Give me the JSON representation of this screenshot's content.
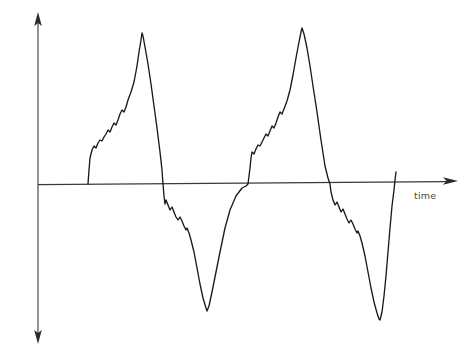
{
  "figure": {
    "title": "",
    "background_color": "#ffffff",
    "width": 470,
    "height": 355
  },
  "axes": {
    "y_label": "amplitude",
    "x_label": "time",
    "axis_color": "#3a3a3a",
    "origin_px": {
      "x": 38,
      "y": 184
    },
    "y_axis_top_px": 16,
    "y_axis_bottom_px": 340,
    "x_axis_right_px": 460,
    "has_y_arrow_up": true,
    "has_y_arrow_down": true,
    "has_x_arrow_right": true,
    "tick_labels_x": [],
    "tick_labels_y": [],
    "grid": false
  },
  "chart_data": {
    "type": "line",
    "title": "",
    "xlabel": "time",
    "ylabel": "amplitude",
    "legend": [],
    "legend_position": "none",
    "grid": false,
    "xlim": [
      0,
      470
    ],
    "ylim": [
      -1.15,
      1.1
    ],
    "line_color": "#1a1a1a",
    "cycles": 2,
    "zero_level_px": 184,
    "peaks": [
      {
        "x_px": 142,
        "y_px": 33,
        "amplitude": 1.0
      },
      {
        "x_px": 268,
        "y_px": 28,
        "amplitude": 1.04
      }
    ],
    "troughs": [
      {
        "x_px": 207,
        "y_px": 311,
        "amplitude": -0.93
      },
      {
        "x_px": 364,
        "y_px": 320,
        "amplitude": -0.99
      }
    ],
    "zero_crossings_px": [
      88,
      163,
      248,
      330,
      388
    ],
    "series": [
      {
        "name": "waveform",
        "points_px": [
          [
            88,
            184
          ],
          [
            89,
            170
          ],
          [
            90,
            158
          ],
          [
            92,
            150
          ],
          [
            94,
            146
          ],
          [
            96,
            148
          ],
          [
            98,
            143
          ],
          [
            100,
            140
          ],
          [
            102,
            141
          ],
          [
            104,
            137
          ],
          [
            106,
            134
          ],
          [
            108,
            130
          ],
          [
            110,
            132
          ],
          [
            112,
            127
          ],
          [
            114,
            123
          ],
          [
            116,
            125
          ],
          [
            118,
            120
          ],
          [
            120,
            114
          ],
          [
            122,
            110
          ],
          [
            124,
            112
          ],
          [
            126,
            107
          ],
          [
            128,
            100
          ],
          [
            131,
            92
          ],
          [
            134,
            82
          ],
          [
            137,
            66
          ],
          [
            139,
            52
          ],
          [
            141,
            40
          ],
          [
            142,
            33
          ],
          [
            143,
            36
          ],
          [
            145,
            47
          ],
          [
            148,
            64
          ],
          [
            151,
            84
          ],
          [
            154,
            106
          ],
          [
            157,
            128
          ],
          [
            160,
            152
          ],
          [
            162,
            170
          ],
          [
            163,
            184
          ],
          [
            164,
            196
          ],
          [
            165,
            204
          ],
          [
            166,
            200
          ],
          [
            168,
            205
          ],
          [
            170,
            210
          ],
          [
            172,
            207
          ],
          [
            174,
            212
          ],
          [
            176,
            217
          ],
          [
            178,
            220
          ],
          [
            180,
            217
          ],
          [
            182,
            221
          ],
          [
            184,
            226
          ],
          [
            186,
            230
          ],
          [
            187,
            228
          ],
          [
            189,
            233
          ],
          [
            191,
            240
          ],
          [
            194,
            252
          ],
          [
            197,
            268
          ],
          [
            200,
            284
          ],
          [
            203,
            298
          ],
          [
            206,
            308
          ],
          [
            207,
            311
          ],
          [
            209,
            306
          ],
          [
            212,
            292
          ],
          [
            216,
            272
          ],
          [
            220,
            252
          ],
          [
            225,
            228
          ],
          [
            230,
            210
          ],
          [
            236,
            196
          ],
          [
            242,
            188
          ],
          [
            246,
            186
          ],
          [
            248,
            184
          ],
          [
            249,
            176
          ],
          [
            250,
            168
          ],
          [
            251,
            158
          ],
          [
            252,
            152
          ],
          [
            254,
            154
          ],
          [
            256,
            149
          ],
          [
            258,
            145
          ],
          [
            260,
            146
          ],
          [
            262,
            142
          ],
          [
            264,
            138
          ],
          [
            266,
            134
          ],
          [
            268,
            136
          ],
          [
            270,
            131
          ],
          [
            272,
            126
          ],
          [
            274,
            128
          ],
          [
            276,
            123
          ],
          [
            278,
            117
          ],
          [
            280,
            112
          ],
          [
            282,
            114
          ],
          [
            284,
            109
          ],
          [
            287,
            101
          ],
          [
            290,
            90
          ],
          [
            293,
            75
          ],
          [
            296,
            58
          ],
          [
            299,
            42
          ],
          [
            301,
            32
          ],
          [
            302,
            28
          ],
          [
            304,
            34
          ],
          [
            307,
            48
          ],
          [
            310,
            66
          ],
          [
            313,
            86
          ],
          [
            317,
            112
          ],
          [
            321,
            140
          ],
          [
            325,
            166
          ],
          [
            328,
            178
          ],
          [
            330,
            184
          ],
          [
            331,
            192
          ],
          [
            333,
            200
          ],
          [
            335,
            205
          ],
          [
            337,
            202
          ],
          [
            339,
            207
          ],
          [
            341,
            212
          ],
          [
            343,
            209
          ],
          [
            345,
            214
          ],
          [
            347,
            219
          ],
          [
            349,
            223
          ],
          [
            351,
            220
          ],
          [
            353,
            224
          ],
          [
            355,
            229
          ],
          [
            357,
            233
          ],
          [
            358,
            231
          ],
          [
            360,
            236
          ],
          [
            362,
            243
          ],
          [
            365,
            256
          ],
          [
            368,
            272
          ],
          [
            371,
            288
          ],
          [
            374,
            302
          ],
          [
            377,
            313
          ],
          [
            379,
            319
          ],
          [
            380,
            320
          ],
          [
            382,
            312
          ],
          [
            384,
            296
          ],
          [
            386,
            276
          ],
          [
            388,
            252
          ],
          [
            390,
            228
          ],
          [
            392,
            206
          ],
          [
            394,
            190
          ],
          [
            395,
            180
          ],
          [
            396,
            172
          ]
        ],
        "note": "Pixel-space polyline of the plotted waveform; y decreases upward in image coordinates."
      }
    ]
  }
}
